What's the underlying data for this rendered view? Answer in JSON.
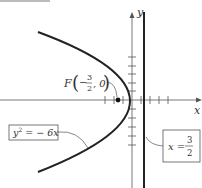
{
  "diagram": {
    "type": "parabola-graph",
    "equation_label": {
      "lhs": "y",
      "exp": "2",
      "rhs": " = − 6x"
    },
    "directrix_label": {
      "lhs": "x = ",
      "num": "3",
      "den": "2"
    },
    "focus_label": {
      "prefix": "F",
      "sign": "−",
      "num": "3",
      "den": "2",
      "suffix": ", 0"
    },
    "x_axis_label": "x",
    "y_axis_label": "y",
    "colors": {
      "stroke": "#222222",
      "axis": "#555555",
      "box": "#555555",
      "text": "#333333"
    }
  }
}
